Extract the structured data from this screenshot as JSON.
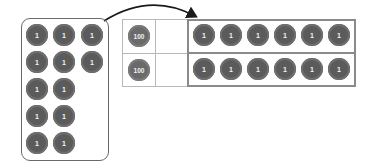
{
  "diagram": {
    "colors": {
      "chip": "#5b5b5b",
      "chip_text": "#f2f2f2",
      "border": "#8a8a8a",
      "grid": "#b8b8b8"
    },
    "left_panel": {
      "chips": [
        {
          "label": "1",
          "x": 26,
          "y": 24
        },
        {
          "label": "1",
          "x": 53,
          "y": 24
        },
        {
          "label": "1",
          "x": 81,
          "y": 24
        },
        {
          "label": "1",
          "x": 26,
          "y": 51
        },
        {
          "label": "1",
          "x": 53,
          "y": 51
        },
        {
          "label": "1",
          "x": 81,
          "y": 51
        },
        {
          "label": "1",
          "x": 26,
          "y": 78
        },
        {
          "label": "1",
          "x": 53,
          "y": 78
        },
        {
          "label": "1",
          "x": 26,
          "y": 105
        },
        {
          "label": "1",
          "x": 53,
          "y": 105
        },
        {
          "label": "1",
          "x": 26,
          "y": 132
        },
        {
          "label": "1",
          "x": 53,
          "y": 132
        }
      ]
    },
    "place_value_chart": {
      "rows": [
        {
          "hundreds": "100",
          "tens": "",
          "ones": [
            "1",
            "1",
            "1",
            "1",
            "1",
            "1"
          ]
        },
        {
          "hundreds": "100",
          "tens": "",
          "ones": [
            "1",
            "1",
            "1",
            "1",
            "1",
            "1"
          ]
        }
      ]
    },
    "arrow": {
      "from": "left-panel",
      "to": "ones-column"
    }
  }
}
